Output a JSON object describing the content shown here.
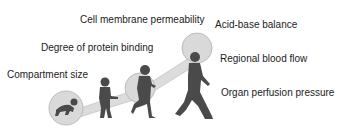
{
  "diagram": {
    "labels_left": [
      {
        "id": "cell-membrane",
        "text": "Cell membrane permeability"
      },
      {
        "id": "protein-binding",
        "text": "Degree of protein binding"
      },
      {
        "id": "compartment",
        "text": "Compartment size"
      }
    ],
    "labels_right": [
      {
        "id": "acid-base",
        "text": "Acid-base balance"
      },
      {
        "id": "regional-blood",
        "text": "Regional blood flow"
      },
      {
        "id": "organ-perfusion",
        "text": "Organ perfusion pressure"
      }
    ],
    "figures": [
      "crawling-infant",
      "toddler",
      "child",
      "walking-youth"
    ],
    "colors": {
      "bubble_fill": "#d9d9d9",
      "bubble_stroke": "#bdbdbd",
      "figure": "#4a4a4a",
      "text": "#222222"
    }
  }
}
